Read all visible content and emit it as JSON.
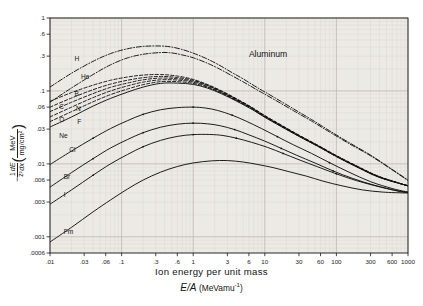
{
  "chart_data": {
    "type": "line",
    "title": "",
    "annotation": "Aluminum",
    "xlabel_line1": "Ion energy per unit mass",
    "xlabel_line2_symbol": "E/A",
    "xlabel_line2_units": "(MeVamu",
    "xlabel_line2_exp": "-1",
    "xlabel_line2_close": ")",
    "ylabel_minus": "−",
    "ylabel_z_num": "1",
    "ylabel_z_den": "z²",
    "ylabel_dedx_num": "dE",
    "ylabel_dedx_den": "dx",
    "ylabel_unit_num": "MeV",
    "ylabel_unit_den": "mg/cm²",
    "xscale": "log",
    "yscale": "log",
    "xlim": [
      0.01,
      1000
    ],
    "ylim": [
      0.0006,
      1
    ],
    "grid": true,
    "xticks": [
      0.01,
      0.03,
      0.06,
      0.1,
      0.3,
      0.6,
      1,
      3,
      6,
      10,
      30,
      60,
      100,
      300,
      600,
      1000
    ],
    "xticklabels": [
      ".01",
      ".03",
      ".06",
      ".1",
      ".3",
      ".6",
      "1",
      "3",
      "6",
      "10",
      "30",
      "60",
      "100",
      "300",
      "600",
      "1000"
    ],
    "yticks": [
      1,
      0.6,
      0.3,
      0.1,
      0.06,
      0.03,
      0.01,
      0.006,
      0.003,
      0.001,
      0.0006
    ],
    "yticklabels": [
      "1",
      ".6",
      ".3",
      ".1",
      ".06",
      ".03",
      ".01",
      ".006",
      ".003",
      ".001",
      ".0006"
    ],
    "legend_position": "inline-curve-labels",
    "series": [
      {
        "name": "H",
        "label": "H",
        "style": "dash-dot",
        "label_x": 0.022,
        "label_y": 0.255,
        "x": [
          0.01,
          0.02,
          0.04,
          0.07,
          0.12,
          0.2,
          0.35,
          0.5,
          0.7,
          1.0,
          1.5,
          2.2,
          3.5,
          5,
          8,
          14,
          25,
          45,
          80,
          150,
          300,
          600,
          1000
        ],
        "y": [
          0.113,
          0.175,
          0.255,
          0.325,
          0.378,
          0.408,
          0.413,
          0.4,
          0.37,
          0.33,
          0.28,
          0.232,
          0.178,
          0.146,
          0.11,
          0.08,
          0.057,
          0.0405,
          0.0285,
          0.0196,
          0.0132,
          0.0084,
          0.006
        ]
      },
      {
        "name": "He",
        "label": "He",
        "style": "dash-dot",
        "label_x": 0.027,
        "label_y": 0.145,
        "x": [
          0.01,
          0.02,
          0.04,
          0.07,
          0.12,
          0.2,
          0.35,
          0.5,
          0.7,
          1.0,
          1.5,
          2.2,
          3.5,
          5,
          8,
          14,
          25,
          45,
          80,
          150,
          300,
          600,
          1000
        ],
        "y": [
          0.07,
          0.11,
          0.168,
          0.228,
          0.283,
          0.318,
          0.336,
          0.332,
          0.312,
          0.285,
          0.245,
          0.206,
          0.161,
          0.133,
          0.102,
          0.0748,
          0.0538,
          0.0386,
          0.0274,
          0.019,
          0.0129,
          0.0083,
          0.0059
        ]
      },
      {
        "name": "B",
        "label": "B",
        "style": "dashed",
        "label_x": 0.022,
        "label_y": 0.085,
        "x": [
          0.01,
          0.02,
          0.04,
          0.07,
          0.12,
          0.2,
          0.35,
          0.6,
          1.0,
          1.6,
          2.5,
          4,
          6.5,
          10,
          17,
          30,
          55,
          100,
          200,
          400,
          1000
        ],
        "y": [
          0.072,
          0.095,
          0.12,
          0.14,
          0.155,
          0.165,
          0.168,
          0.16,
          0.144,
          0.122,
          0.1,
          0.0785,
          0.06,
          0.046,
          0.034,
          0.0248,
          0.018,
          0.013,
          0.0092,
          0.0067,
          0.005
        ]
      },
      {
        "name": "C",
        "label": "C",
        "style": "dashed",
        "label_x": 0.0135,
        "label_y": 0.057,
        "x": [
          0.01,
          0.02,
          0.04,
          0.07,
          0.12,
          0.2,
          0.35,
          0.6,
          1.0,
          1.6,
          2.5,
          4,
          6.5,
          10,
          17,
          30,
          55,
          100,
          200,
          400,
          1000
        ],
        "y": [
          0.06,
          0.08,
          0.104,
          0.124,
          0.14,
          0.152,
          0.158,
          0.153,
          0.14,
          0.12,
          0.0985,
          0.0775,
          0.0595,
          0.0455,
          0.0337,
          0.0246,
          0.0179,
          0.0129,
          0.0091,
          0.0066,
          0.005
        ]
      },
      {
        "name": "N",
        "label": "N",
        "style": "dashed",
        "label_x": 0.023,
        "label_y": 0.053,
        "x": [
          0.01,
          0.02,
          0.04,
          0.07,
          0.12,
          0.2,
          0.35,
          0.6,
          1.0,
          1.6,
          2.5,
          4,
          6.5,
          10,
          17,
          30,
          55,
          100,
          200,
          400,
          1000
        ],
        "y": [
          0.052,
          0.07,
          0.092,
          0.112,
          0.128,
          0.142,
          0.15,
          0.147,
          0.136,
          0.118,
          0.097,
          0.0765,
          0.0588,
          0.045,
          0.0334,
          0.0244,
          0.0178,
          0.0128,
          0.0091,
          0.0066,
          0.005
        ]
      },
      {
        "name": "O",
        "label": "O",
        "style": "dashed",
        "label_x": 0.0135,
        "label_y": 0.037,
        "x": [
          0.01,
          0.02,
          0.04,
          0.07,
          0.12,
          0.2,
          0.35,
          0.6,
          1.0,
          1.6,
          2.5,
          4,
          6.5,
          10,
          17,
          30,
          55,
          100,
          200,
          400,
          1000
        ],
        "y": [
          0.044,
          0.06,
          0.081,
          0.1,
          0.117,
          0.132,
          0.142,
          0.141,
          0.132,
          0.115,
          0.0952,
          0.0752,
          0.058,
          0.0445,
          0.033,
          0.0242,
          0.0176,
          0.0127,
          0.009,
          0.0066,
          0.005
        ]
      },
      {
        "name": "F",
        "label": "F",
        "style": "dashed",
        "label_x": 0.024,
        "label_y": 0.0355,
        "x": [
          0.01,
          0.02,
          0.04,
          0.07,
          0.12,
          0.2,
          0.35,
          0.6,
          1.0,
          1.6,
          2.5,
          4,
          6.5,
          10,
          17,
          30,
          55,
          100,
          200,
          400,
          1000
        ],
        "y": [
          0.038,
          0.052,
          0.071,
          0.089,
          0.106,
          0.122,
          0.134,
          0.134,
          0.127,
          0.112,
          0.0932,
          0.074,
          0.0572,
          0.044,
          0.0327,
          0.024,
          0.0175,
          0.0126,
          0.009,
          0.0066,
          0.005
        ]
      },
      {
        "name": "Ne",
        "label": "Ne",
        "style": "solid",
        "label_x": 0.0135,
        "label_y": 0.0228,
        "x": [
          0.01,
          0.02,
          0.04,
          0.07,
          0.12,
          0.2,
          0.35,
          0.6,
          1.0,
          1.6,
          2.5,
          4,
          6.5,
          10,
          17,
          30,
          55,
          100,
          200,
          400,
          1000
        ],
        "y": [
          0.032,
          0.044,
          0.062,
          0.079,
          0.096,
          0.113,
          0.127,
          0.128,
          0.123,
          0.109,
          0.0912,
          0.0728,
          0.0564,
          0.0435,
          0.0324,
          0.0238,
          0.0174,
          0.0126,
          0.0089,
          0.0065,
          0.005
        ]
      },
      {
        "name": "Cl",
        "label": "Cl",
        "style": "solid-marked",
        "label_x": 0.0185,
        "label_y": 0.0145,
        "x": [
          0.01,
          0.02,
          0.04,
          0.07,
          0.12,
          0.2,
          0.35,
          0.6,
          1.0,
          1.5,
          2.2,
          3.5,
          5.5,
          9,
          15,
          25,
          45,
          80,
          150,
          300,
          600,
          1000
        ],
        "y": [
          0.0098,
          0.015,
          0.0225,
          0.0305,
          0.039,
          0.0478,
          0.0552,
          0.059,
          0.06,
          0.0582,
          0.054,
          0.0465,
          0.0385,
          0.0305,
          0.0236,
          0.0183,
          0.0139,
          0.0104,
          0.0077,
          0.0057,
          0.0046,
          0.0041
        ]
      },
      {
        "name": "Br",
        "label": "Br",
        "style": "solid-marked",
        "label_x": 0.0155,
        "label_y": 0.0062,
        "x": [
          0.01,
          0.02,
          0.04,
          0.07,
          0.12,
          0.2,
          0.35,
          0.6,
          1.0,
          1.6,
          2.4,
          3.8,
          6,
          10,
          17,
          28,
          50,
          90,
          170,
          340,
          700,
          1000
        ],
        "y": [
          0.0048,
          0.0076,
          0.0118,
          0.0165,
          0.0215,
          0.0268,
          0.0318,
          0.035,
          0.0362,
          0.0354,
          0.0333,
          0.0295,
          0.025,
          0.0205,
          0.0163,
          0.0131,
          0.0103,
          0.008,
          0.0063,
          0.0051,
          0.0043,
          0.0041
        ]
      },
      {
        "name": "I",
        "label": "I",
        "style": "solid-marked",
        "label_x": 0.0155,
        "label_y": 0.0035,
        "x": [
          0.01,
          0.02,
          0.04,
          0.07,
          0.12,
          0.2,
          0.35,
          0.6,
          1.0,
          1.7,
          2.6,
          4,
          6.5,
          11,
          18,
          30,
          55,
          100,
          190,
          380,
          750,
          1000
        ],
        "y": [
          0.0028,
          0.0044,
          0.007,
          0.01,
          0.0134,
          0.0172,
          0.021,
          0.0238,
          0.0252,
          0.0253,
          0.0245,
          0.0225,
          0.0198,
          0.0168,
          0.0139,
          0.0114,
          0.0091,
          0.0073,
          0.0059,
          0.0049,
          0.0042,
          0.004
        ]
      },
      {
        "name": "Fm",
        "label": "Fm",
        "style": "solid",
        "label_x": 0.0155,
        "label_y": 0.00108,
        "x": [
          0.01,
          0.02,
          0.04,
          0.07,
          0.12,
          0.2,
          0.35,
          0.6,
          1.0,
          1.8,
          3,
          5,
          8,
          13,
          22,
          38,
          65,
          120,
          230,
          450,
          850,
          1000
        ],
        "y": [
          0.00085,
          0.00135,
          0.0022,
          0.0032,
          0.0045,
          0.006,
          0.0077,
          0.0092,
          0.0103,
          0.011,
          0.0111,
          0.0106,
          0.0098,
          0.0089,
          0.0078,
          0.0068,
          0.0058,
          0.005,
          0.0044,
          0.0041,
          0.004,
          0.004
        ]
      }
    ],
    "colors": {
      "axis": "#1a1a1a",
      "grid_minor": "#d8d5d0",
      "grid_major": "#b8b4ae",
      "curve": "#111111",
      "plot_bg": "#eceae5"
    }
  }
}
